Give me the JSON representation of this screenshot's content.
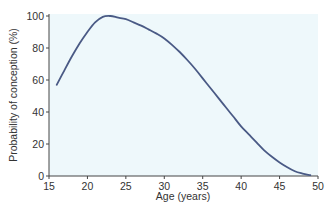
{
  "chart_data": {
    "type": "line",
    "title": "",
    "xlabel": "Age (years)",
    "ylabel": "Probability of conception (%)",
    "xlim": [
      15,
      50
    ],
    "ylim": [
      0,
      100
    ],
    "x_ticks": [
      15,
      20,
      25,
      30,
      35,
      40,
      45,
      50
    ],
    "y_ticks": [
      0,
      20,
      40,
      60,
      80,
      100
    ],
    "grid": false,
    "legend": null,
    "series": [
      {
        "name": "Probability of conception",
        "x": [
          16,
          17,
          18,
          19,
          20,
          21,
          22,
          23,
          24,
          25,
          26,
          27,
          28,
          29,
          30,
          31,
          32,
          33,
          34,
          35,
          36,
          37,
          38,
          39,
          40,
          41,
          42,
          43,
          44,
          45,
          46,
          47,
          48,
          49
        ],
        "y": [
          57,
          66,
          75,
          83,
          90,
          96,
          99.5,
          100,
          99,
          98,
          96,
          94,
          91.5,
          89,
          86,
          82,
          77.5,
          72.5,
          67,
          61,
          55,
          49,
          43,
          37,
          31,
          26,
          21,
          16,
          12,
          8.5,
          5.5,
          3,
          1.5,
          0.5
        ]
      }
    ],
    "colors": {
      "line": "#4a5a85",
      "plot_background": "#eef8fb",
      "axis": "#444444"
    }
  }
}
